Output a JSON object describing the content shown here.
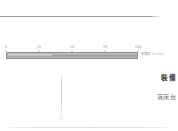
{
  "document": {
    "top_rule": "",
    "bottom_rule": ""
  },
  "gauge": {
    "caption": "照護度（0-100）",
    "value": 100,
    "min": 0,
    "max": 100,
    "ticks": [
      {
        "label": "0",
        "position": 0
      },
      {
        "label": "25",
        "position": 25
      },
      {
        "label": "50",
        "position": 50
      },
      {
        "label": "75",
        "position": 75
      },
      {
        "label": "100",
        "position": 100
      }
    ]
  },
  "right_column": {
    "heading": "裝備",
    "subheading": "蒸床台"
  },
  "colors": {
    "rule": "#9a9a9a",
    "bar_fill": "#a8a8a8",
    "bar_border": "#8d8d8d",
    "tick_label": "#8e8e8e",
    "heading": "#3f3f3f",
    "subheading": "#6e6e6e",
    "divider": "#d2d2d2",
    "background": "#ffffff"
  }
}
